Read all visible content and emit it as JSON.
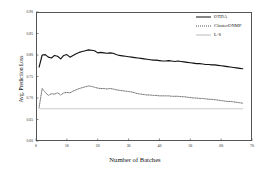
{
  "chart_data": {
    "type": "line",
    "title": "",
    "xlabel": "Number of Batches",
    "ylabel": "Avg. Prediction Loss",
    "xlim": [
      0,
      70
    ],
    "ylim": [
      0.6,
      0.9
    ],
    "grid": false,
    "legend_position": "top-right",
    "xticks": [
      "0",
      "10",
      "20",
      "30",
      "40",
      "50",
      "60",
      "70"
    ],
    "yticks": [
      "0.60",
      "0.65",
      "0.70",
      "0.75",
      "0.80",
      "0.85",
      "0.90"
    ],
    "series": [
      {
        "name": "OTDA",
        "style": "solid",
        "color": "#111111",
        "x": [
          1,
          2,
          3,
          4,
          5,
          6,
          7,
          8,
          9,
          10,
          11,
          12,
          13,
          14,
          15,
          16,
          17,
          18,
          19,
          20,
          21,
          22,
          23,
          24,
          25,
          26,
          27,
          28,
          29,
          30,
          31,
          32,
          33,
          34,
          35,
          36,
          37,
          38,
          39,
          40,
          41,
          42,
          43,
          44,
          45,
          46,
          47,
          48,
          49,
          50,
          51,
          52,
          53,
          54,
          55,
          56,
          57,
          58,
          59,
          60,
          61,
          62,
          63,
          64,
          65,
          66,
          67
        ],
        "values": [
          0.772,
          0.8,
          0.801,
          0.795,
          0.793,
          0.799,
          0.797,
          0.791,
          0.799,
          0.801,
          0.795,
          0.799,
          0.803,
          0.806,
          0.808,
          0.81,
          0.812,
          0.811,
          0.81,
          0.805,
          0.806,
          0.805,
          0.804,
          0.805,
          0.804,
          0.801,
          0.799,
          0.798,
          0.797,
          0.796,
          0.795,
          0.794,
          0.793,
          0.792,
          0.791,
          0.79,
          0.789,
          0.788,
          0.788,
          0.787,
          0.786,
          0.786,
          0.787,
          0.786,
          0.785,
          0.786,
          0.785,
          0.784,
          0.783,
          0.782,
          0.781,
          0.78,
          0.78,
          0.779,
          0.778,
          0.778,
          0.777,
          0.777,
          0.776,
          0.775,
          0.774,
          0.773,
          0.772,
          0.771,
          0.77,
          0.769,
          0.768
        ]
      },
      {
        "name": "ClusterONMF",
        "style": "dotted",
        "color": "#555555",
        "x": [
          1,
          2,
          3,
          4,
          5,
          6,
          7,
          8,
          9,
          10,
          11,
          12,
          13,
          14,
          15,
          16,
          17,
          18,
          19,
          20,
          21,
          22,
          23,
          24,
          25,
          26,
          27,
          28,
          29,
          30,
          31,
          32,
          33,
          34,
          35,
          36,
          37,
          38,
          39,
          40,
          41,
          42,
          43,
          44,
          45,
          46,
          47,
          48,
          49,
          50,
          51,
          52,
          53,
          54,
          55,
          56,
          57,
          58,
          59,
          60,
          61,
          62,
          63,
          64,
          65,
          66,
          67
        ],
        "values": [
          0.678,
          0.722,
          0.713,
          0.706,
          0.71,
          0.709,
          0.712,
          0.707,
          0.712,
          0.713,
          0.712,
          0.716,
          0.719,
          0.722,
          0.724,
          0.726,
          0.728,
          0.727,
          0.725,
          0.723,
          0.722,
          0.722,
          0.721,
          0.722,
          0.721,
          0.719,
          0.718,
          0.717,
          0.716,
          0.715,
          0.714,
          0.712,
          0.71,
          0.709,
          0.708,
          0.707,
          0.707,
          0.706,
          0.706,
          0.705,
          0.705,
          0.705,
          0.705,
          0.704,
          0.704,
          0.704,
          0.703,
          0.703,
          0.702,
          0.701,
          0.7,
          0.7,
          0.699,
          0.699,
          0.698,
          0.697,
          0.697,
          0.696,
          0.695,
          0.694,
          0.693,
          0.692,
          0.692,
          0.691,
          0.69,
          0.689,
          0.688
        ]
      },
      {
        "name": "L-S",
        "style": "flat",
        "color": "#b9b9b9",
        "x": [
          1,
          67
        ],
        "values": [
          0.675,
          0.675
        ]
      }
    ]
  }
}
